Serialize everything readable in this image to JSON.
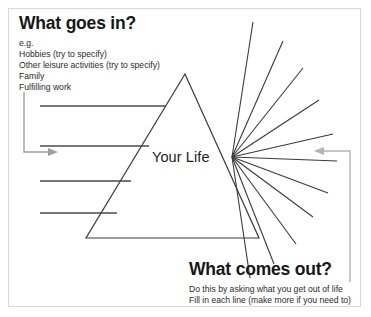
{
  "diagram": {
    "title_input": "What goes in?",
    "title_output": "What comes out?",
    "center_label": "Your Life",
    "input_examples": [
      "e.g.",
      "Hobbies (try to specify)",
      "Other leisure activities (try to specify)",
      "Family",
      "Fulfilling work"
    ],
    "output_instructions": [
      "Do this by asking what you get out of life",
      "Fill in each line (make more if you need to)"
    ],
    "colors": {
      "ink": "#1d1d1d",
      "line": "#3a3a3a",
      "arrow": "#9a9a9a",
      "border": "#d8d8d8",
      "background": "#ffffff"
    },
    "shapes": {
      "triangle": {
        "apex_x": 185,
        "apex_y": 74,
        "left_x": 86,
        "right_x": 259,
        "base_y": 238
      },
      "fan_origin": {
        "x": 232,
        "y": 157
      },
      "input_line_count": 4,
      "output_line_count": 11
    },
    "input_lines": [
      {
        "x1": 40,
        "y1": 106,
        "x2": 166,
        "y2": 106
      },
      {
        "x1": 40,
        "y1": 146,
        "x2": 149,
        "y2": 146
      },
      {
        "x1": 40,
        "y1": 181,
        "x2": 131,
        "y2": 181
      },
      {
        "x1": 40,
        "y1": 213,
        "x2": 117,
        "y2": 213
      }
    ],
    "output_lines": [
      {
        "x2": 253,
        "y2": 22
      },
      {
        "x2": 283,
        "y2": 41
      },
      {
        "x2": 303,
        "y2": 68
      },
      {
        "x2": 319,
        "y2": 100
      },
      {
        "x2": 333,
        "y2": 134
      },
      {
        "x2": 337,
        "y2": 161
      },
      {
        "x2": 328,
        "y2": 193
      },
      {
        "x2": 313,
        "y2": 217
      },
      {
        "x2": 296,
        "y2": 244
      },
      {
        "x2": 274,
        "y2": 264
      },
      {
        "x2": 250,
        "y2": 278
      }
    ],
    "arrow_in": {
      "path": "M 24,92 L 24,152 L 52,152",
      "head": "58,152 48,148 48,156"
    },
    "arrow_out": {
      "path": "M 350,282 L 350,151 L 322,151",
      "head": "314,151 324,147 324,155"
    }
  }
}
